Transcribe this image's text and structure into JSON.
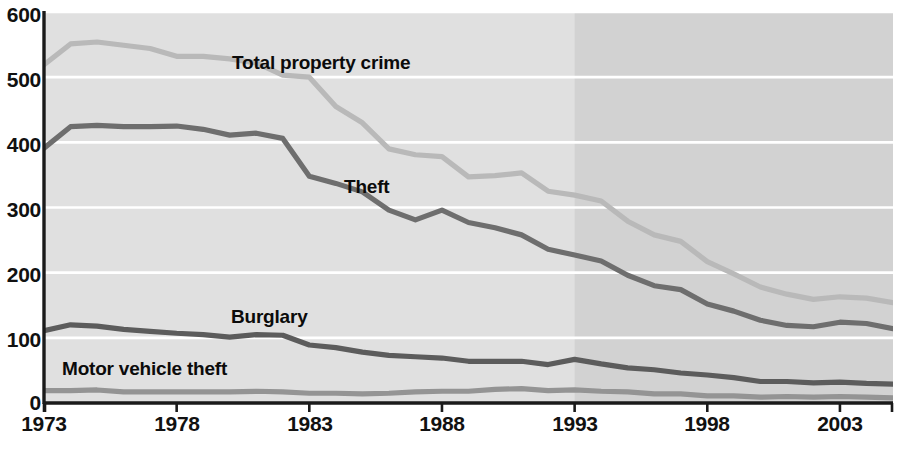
{
  "chart_data": {
    "type": "line",
    "title": "",
    "subtitle": "",
    "xlabel": "",
    "ylabel": "",
    "xlim": [
      1973,
      2005
    ],
    "ylim": [
      0,
      600
    ],
    "grid": true,
    "legend_position": "inline-annotations",
    "y_ticks": [
      600,
      500,
      400,
      300,
      200,
      100,
      0
    ],
    "x_ticks": [
      1973,
      1978,
      1983,
      1988,
      1993,
      1998,
      2003
    ],
    "x_tick_labels": [
      "1973",
      "1978",
      "1983",
      "1988",
      "1993",
      "1998",
      "2003"
    ],
    "y_tick_labels": [
      "600",
      "500",
      "400",
      "300",
      "200",
      "100",
      "0"
    ],
    "x": [
      1973,
      1974,
      1975,
      1976,
      1977,
      1978,
      1979,
      1980,
      1981,
      1982,
      1983,
      1984,
      1985,
      1986,
      1987,
      1988,
      1989,
      1990,
      1991,
      1992,
      1993,
      1994,
      1995,
      1996,
      1997,
      1998,
      1999,
      2000,
      2001,
      2002,
      2003,
      2004,
      2005
    ],
    "shaded_region": {
      "from": 1993,
      "to": 2005,
      "color": "#d2d2d2",
      "note": "darker background panel from 1993 onward"
    },
    "plot_background": "#e0e0e0",
    "gridline_color": "#ffffff",
    "axis_color": "#1a1a1a",
    "series": [
      {
        "name": "Total property crime",
        "color": "#b9b9b9",
        "label_x": 1981,
        "label_y": 520,
        "values": [
          519,
          551,
          554,
          549,
          544,
          532,
          532,
          528,
          522,
          503,
          500,
          455,
          430,
          390,
          381,
          378,
          347,
          349,
          353,
          325,
          319,
          310,
          279,
          258,
          248,
          217,
          198,
          178,
          167,
          159,
          163,
          161,
          154
        ]
      },
      {
        "name": "Theft",
        "color": "#6e6e6e",
        "label_x": 1984,
        "label_y": 322,
        "values": [
          391,
          424,
          426,
          424,
          424,
          425,
          420,
          411,
          414,
          406,
          348,
          337,
          324,
          296,
          281,
          296,
          277,
          269,
          258,
          236,
          227,
          218,
          196,
          180,
          174,
          152,
          141,
          127,
          119,
          117,
          124,
          122,
          114
        ]
      },
      {
        "name": "Burglary",
        "color": "#5c5c5c",
        "label_x": 1980,
        "label_y": 152,
        "values": [
          111,
          120,
          118,
          113,
          110,
          107,
          105,
          101,
          105,
          104,
          89,
          85,
          78,
          73,
          71,
          69,
          64,
          64,
          64,
          59,
          67,
          60,
          54,
          51,
          46,
          43,
          39,
          33,
          33,
          31,
          32,
          30,
          29
        ]
      },
      {
        "name": "Motor vehicle theft",
        "color": "#949494",
        "label_x": 1975,
        "label_y": 58,
        "values": [
          19,
          19,
          20,
          17,
          17,
          17,
          17,
          17,
          18,
          17,
          15,
          15,
          14,
          15,
          17,
          18,
          18,
          21,
          22,
          19,
          20,
          18,
          17,
          14,
          14,
          11,
          11,
          9,
          10,
          9,
          10,
          9,
          8
        ]
      }
    ]
  },
  "labels": {
    "total_property_crime": "Total property crime",
    "theft": "Theft",
    "burglary": "Burglary",
    "motor_vehicle_theft": "Motor vehicle theft"
  }
}
